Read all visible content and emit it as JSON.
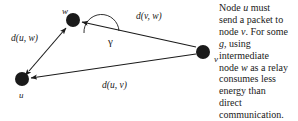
{
  "figure": {
    "type": "network-relay-diagram",
    "background_color": "#ffffff",
    "ink_color": "#1a1a1a",
    "nodes": [
      {
        "id": "w",
        "label": "w",
        "cx": 73,
        "cy": 20,
        "r": 7
      },
      {
        "id": "u",
        "label": "u",
        "cx": 22,
        "cy": 79,
        "r": 7
      },
      {
        "id": "v",
        "label": "v",
        "cx": 203,
        "cy": 52,
        "r": 7
      }
    ],
    "edges": [
      {
        "id": "u-w",
        "from": "u",
        "to": "w",
        "label": "d(u, w)",
        "arrows": "both"
      },
      {
        "id": "v-w",
        "from": "v",
        "to": "w",
        "label": "d(v, w)",
        "arrows": "to"
      },
      {
        "id": "v-u",
        "from": "v",
        "to": "u",
        "label": "d(u, v)",
        "arrows": "to"
      }
    ],
    "angle": {
      "id": "gamma",
      "label": "γ",
      "vertex": "w",
      "between": [
        "u-w",
        "v-w"
      ]
    }
  },
  "caption": {
    "lines": [
      [
        {
          "t": "Node "
        },
        {
          "t": "u",
          "italic": true
        },
        {
          "t": " must"
        }
      ],
      [
        {
          "t": "send a packet to"
        }
      ],
      [
        {
          "t": "node "
        },
        {
          "t": "v",
          "italic": true
        },
        {
          "t": ".  For some"
        }
      ],
      [
        {
          "t": "g",
          "italic": true
        },
        {
          "t": ", using"
        }
      ],
      [
        {
          "t": "intermediate"
        }
      ],
      [
        {
          "t": "node "
        },
        {
          "t": "w",
          "italic": true
        },
        {
          "t": " as a relay"
        }
      ],
      [
        {
          "t": "consumes less"
        }
      ],
      [
        {
          "t": "energy than"
        }
      ],
      [
        {
          "t": "direct"
        }
      ],
      [
        {
          "t": "communication."
        }
      ]
    ]
  }
}
